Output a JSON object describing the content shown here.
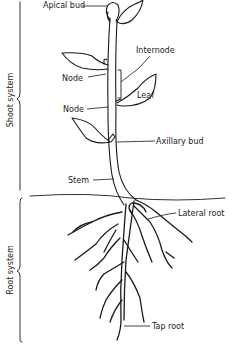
{
  "diagram": {
    "labels": {
      "apical_bud": "Apical bud",
      "internode": "Internode",
      "node_upper": "Node",
      "leaf": "Leaf",
      "node_lower": "Node",
      "axillary_bud": "Axillary bud",
      "stem": "Stem",
      "lateral_root": "Lateral root",
      "tap_root": "Tap root"
    },
    "brackets": {
      "shoot_system": "Shoot system",
      "root_system": "Root system"
    },
    "colors": {
      "ink": "#1a1a1a",
      "background": "#ffffff"
    }
  }
}
